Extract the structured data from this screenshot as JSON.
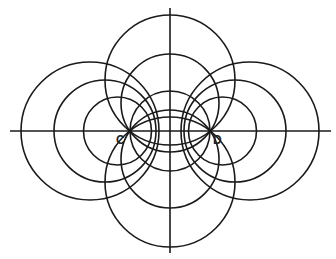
{
  "diagram": {
    "title": "",
    "stroke_color": "#1a1a1a",
    "axes": {
      "horizontal": {
        "x1": 10,
        "y": 131,
        "x2": 331
      },
      "vertical": {
        "x": 170,
        "y1": 8,
        "y2": 253
      }
    },
    "points": [
      {
        "label": "C",
        "x": 130,
        "y": 131,
        "label_x": 116,
        "label_y": 134
      },
      {
        "label": "D",
        "x": 210,
        "y": 131,
        "label_x": 213,
        "label_y": 134
      }
    ],
    "circles_through_C_and_D": [
      {
        "cx": 170,
        "cy": 80,
        "r": 65
      },
      {
        "cx": 170,
        "cy": 103,
        "r": 49
      },
      {
        "cx": 170,
        "cy": 131,
        "r": 40
      },
      {
        "cx": 170,
        "cy": 159,
        "r": 49
      },
      {
        "cx": 170,
        "cy": 182,
        "r": 65
      }
    ],
    "apollonian_circles_around_C": [
      {
        "cx": 90,
        "cy": 131,
        "r": 69
      },
      {
        "cx": 105,
        "cy": 131,
        "r": 51
      },
      {
        "cx": 117.5,
        "cy": 131,
        "r": 34
      }
    ],
    "apollonian_circles_around_D": [
      {
        "cx": 250,
        "cy": 131,
        "r": 69
      },
      {
        "cx": 235,
        "cy": 131,
        "r": 51
      },
      {
        "cx": 222.5,
        "cy": 131,
        "r": 34
      }
    ]
  }
}
